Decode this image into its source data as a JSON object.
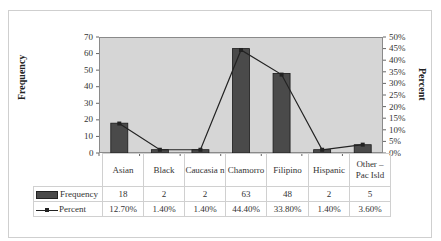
{
  "chart_data": {
    "type": "bar",
    "categories": [
      "Asian",
      "Black",
      "Caucasian",
      "Chamorro",
      "Filipino",
      "Hispanic",
      "Other – Pac Isld"
    ],
    "series": [
      {
        "name": "Frequency",
        "type": "bar",
        "axis": "left",
        "values": [
          18,
          2,
          2,
          63,
          48,
          2,
          5
        ]
      },
      {
        "name": "Percent",
        "type": "line",
        "axis": "right",
        "values": [
          12.7,
          1.4,
          1.4,
          44.4,
          33.8,
          1.4,
          3.6
        ]
      }
    ],
    "title": "",
    "xlabel": "",
    "ylabel": "Frequency",
    "ylabel_right": "Percent",
    "ylim": [
      0,
      70
    ],
    "ylim_right": [
      0,
      50
    ],
    "yticks": [
      0,
      10,
      20,
      30,
      40,
      50,
      60,
      70
    ],
    "yticks_right": [
      "0%",
      "5%",
      "10%",
      "15%",
      "20%",
      "25%",
      "30%",
      "35%",
      "40%",
      "45%",
      "50%"
    ],
    "grid": false,
    "legend_position": "data-table",
    "data_table": true
  },
  "axes": {
    "left_label": "Frequency",
    "right_label": "Percent",
    "left_ticks": [
      "70",
      "60",
      "50",
      "40",
      "30",
      "20",
      "10",
      "0"
    ],
    "right_ticks": [
      "50%",
      "45%",
      "40%",
      "35%",
      "30%",
      "25%",
      "20%",
      "15%",
      "10%",
      "5%",
      "0%"
    ]
  },
  "table": {
    "headers": [
      "Asian",
      "Black",
      "Caucasia n",
      "Chamorro",
      "Filipino",
      "Hispanic",
      "Other – Pac Isld"
    ],
    "rows": [
      {
        "label": "Frequency",
        "cells": [
          "18",
          "2",
          "2",
          "63",
          "48",
          "2",
          "5"
        ]
      },
      {
        "label": "Percent",
        "cells": [
          "12.70%",
          "1.40%",
          "1.40%",
          "44.40%",
          "33.80%",
          "1.40%",
          "3.60%"
        ]
      }
    ]
  },
  "colors": {
    "plot_bg": "#d6d6d6",
    "bar": "#4a4a4a",
    "line": "#222222"
  }
}
